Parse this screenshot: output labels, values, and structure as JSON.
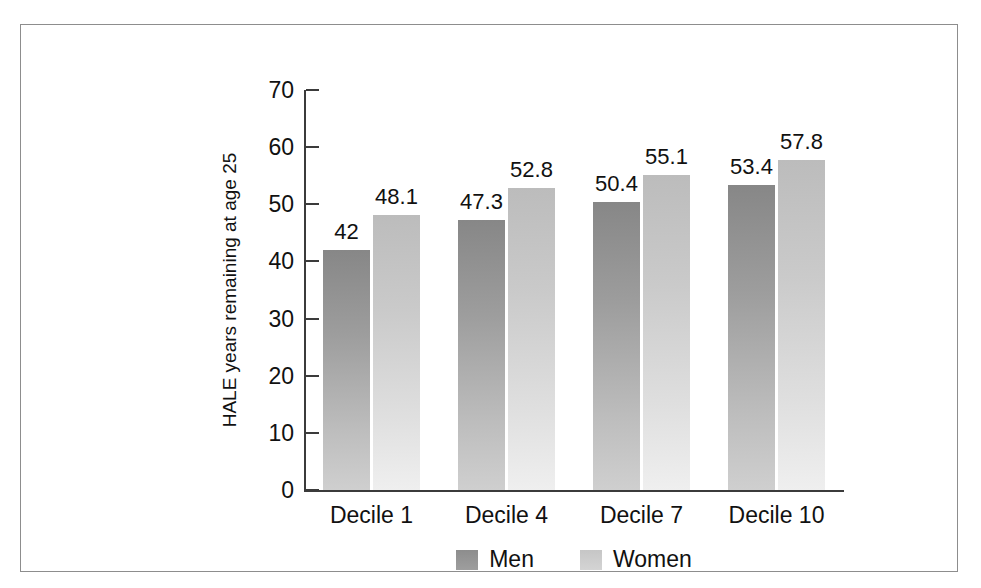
{
  "chart_data": {
    "type": "bar",
    "title": "",
    "subtitle": "",
    "xlabel": "",
    "ylabel": "HALE years remaining at age 25",
    "ylim": [
      0,
      70
    ],
    "y_ticks": [
      0,
      10,
      20,
      30,
      40,
      50,
      60,
      70
    ],
    "grid": false,
    "legend_position": "bottom-center",
    "categories": [
      "Decile 1",
      "Decile 4",
      "Decile 7",
      "Decile 10"
    ],
    "series": [
      {
        "name": "Men",
        "color": "#9d9d9d",
        "values": [
          42,
          47.3,
          50.4,
          53.4
        ],
        "labels": [
          "42",
          "47.3",
          "50.4",
          "53.4"
        ]
      },
      {
        "name": "Women",
        "color": "#d0d0d0",
        "values": [
          48.1,
          52.8,
          55.1,
          57.8
        ],
        "labels": [
          "48.1",
          "52.8",
          "55.1",
          "57.8"
        ]
      }
    ]
  },
  "axis": {
    "tick_labels": [
      "70",
      "60",
      "50",
      "40",
      "30",
      "20",
      "10",
      "0"
    ]
  },
  "legend": {
    "items": [
      {
        "label": "Men"
      },
      {
        "label": "Women"
      }
    ]
  },
  "colors": {
    "frame": "#8d8d8d",
    "axis": "#3b3b3b",
    "text": "#111111",
    "men_bar_top": "#878787",
    "men_bar_bottom": "#cfcfcf",
    "women_bar_top": "#bcbcbc",
    "women_bar_bottom": "#efefef"
  }
}
